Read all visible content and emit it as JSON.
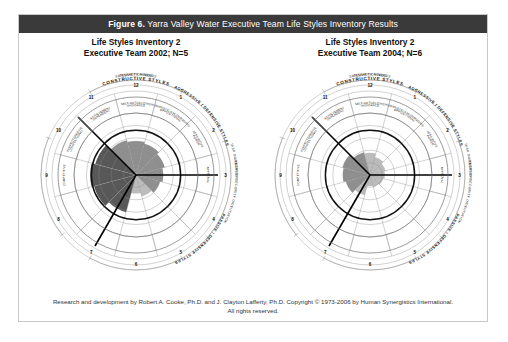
{
  "figure": {
    "number_label": "Figure 6.",
    "title": "Yarra Valley Water Executive Team Life Styles Inventory Results",
    "titlebar_color": "#3a3a3a",
    "frame_border_color": "#c9c9c9"
  },
  "panels": [
    {
      "heading_line1": "Life Styles Inventory 2",
      "heading_line2": "Executive Team 2002; N=5",
      "year": "2002",
      "n": "N=5"
    },
    {
      "heading_line1": "Life Styles Inventory 2",
      "heading_line2": "Executive Team 2004; N=6",
      "year": "2004",
      "n": "N=6"
    }
  ],
  "circumplex": {
    "outer_arcs": {
      "satisfaction_needs": "SATISFACTION NEEDS",
      "security_needs": "SECURITY NEEDS",
      "task_orientation": "TASK ORIENTATION",
      "people_orientation": "PEOPLE / SECURITY ORIENTATION",
      "constructive_styles": "CONSTRUCTIVE STYLES",
      "passive_defensive_styles": "PASSIVE / DEFENSIVE STYLES",
      "aggressive_defensive_styles": "AGGRESSIVE / DEFENSIVE STYLES"
    },
    "segments": [
      {
        "position": "1",
        "label": "HUMANISTIC-ENCOURAGING",
        "group": "constructive"
      },
      {
        "position": "2",
        "label": "AFFILIATIVE",
        "group": "constructive"
      },
      {
        "position": "3",
        "label": "APPROVAL",
        "group": "passive-defensive"
      },
      {
        "position": "4",
        "label": "CONVENTIONAL",
        "group": "passive-defensive"
      },
      {
        "position": "5",
        "label": "DEPENDENT",
        "group": "passive-defensive"
      },
      {
        "position": "6",
        "label": "AVOIDANCE",
        "group": "passive-defensive"
      },
      {
        "position": "7",
        "label": "OPPOSITIONAL",
        "group": "aggressive-defensive"
      },
      {
        "position": "8",
        "label": "POWER",
        "group": "aggressive-defensive"
      },
      {
        "position": "9",
        "label": "COMPETITIVE",
        "group": "aggressive-defensive"
      },
      {
        "position": "10",
        "label": "PERFECTIONISTIC",
        "group": "aggressive-defensive"
      },
      {
        "position": "11",
        "label": "ACHIEVEMENT",
        "group": "constructive"
      },
      {
        "position": "12",
        "label": "SELF-ACTUALIZING",
        "group": "constructive"
      }
    ],
    "ring_count": 5,
    "colors": {
      "grid_line": "#8a8a8a",
      "outer_ring_line": "#6f6f6f",
      "profile_dark": "#585858",
      "profile_mid": "#8f8f8f",
      "profile_light": "#bcbcbc",
      "profile_outline": "#111111"
    }
  },
  "chart_data": [
    {
      "type": "radar",
      "title": "Life Styles Inventory 2 — Executive Team 2002; N=5",
      "categories": [
        "1 HUMANISTIC-ENCOURAGING",
        "2 AFFILIATIVE",
        "3 APPROVAL",
        "4 CONVENTIONAL",
        "5 DEPENDENT",
        "6 AVOIDANCE",
        "7 OPPOSITIONAL",
        "8 POWER",
        "9 COMPETITIVE",
        "10 PERFECTIONISTIC",
        "11 ACHIEVEMENT",
        "12 SELF-ACTUALIZING"
      ],
      "values": [
        52,
        48,
        44,
        40,
        36,
        30,
        62,
        70,
        74,
        68,
        58,
        55
      ],
      "ylim": [
        0,
        100
      ],
      "ylabel": "Percentile",
      "grid": true,
      "legend": "none"
    },
    {
      "type": "radar",
      "title": "Life Styles Inventory 2 — Executive Team 2004; N=6",
      "categories": [
        "1 HUMANISTIC-ENCOURAGING",
        "2 AFFILIATIVE",
        "3 APPROVAL",
        "4 CONVENTIONAL",
        "5 DEPENDENT",
        "6 AVOIDANCE",
        "7 OPPOSITIONAL",
        "8 POWER",
        "9 COMPETITIVE",
        "10 PERFECTIONISTIC",
        "11 ACHIEVEMENT",
        "12 SELF-ACTUALIZING"
      ],
      "values": [
        30,
        26,
        24,
        22,
        20,
        18,
        34,
        40,
        44,
        46,
        38,
        36
      ],
      "ylim": [
        0,
        100
      ],
      "ylabel": "Percentile",
      "grid": true,
      "legend": "none"
    }
  ],
  "footer": {
    "line1": "Research and development by Robert A. Cooke, Ph.D. and J. Clayton Lafferty, Ph.D. Copyright © 1973-2006 by Human Synergistics International.",
    "line2": "All rights reserved."
  }
}
